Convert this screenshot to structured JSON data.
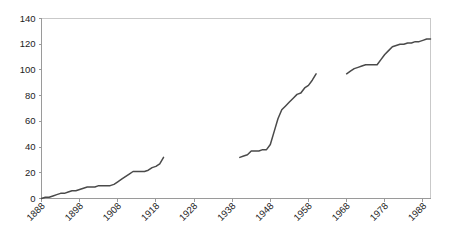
{
  "chart_data": {
    "type": "line",
    "title": "",
    "subtitle": "",
    "xlabel": "",
    "ylabel": "",
    "xlim": [
      1888,
      1990
    ],
    "ylim": [
      0,
      140
    ],
    "grid": false,
    "legend": false,
    "legend_position": "none",
    "line_color": "#4a4a4a",
    "axis_color": "#9a9a9a",
    "border_color": "#c9c9c9",
    "y_ticks": [
      0,
      20,
      40,
      60,
      80,
      100,
      120,
      140
    ],
    "y_tick_labels": [
      "0",
      "20",
      "40",
      "60",
      "80",
      "100",
      "120",
      "140"
    ],
    "x_ticks": [
      1888,
      1898,
      1908,
      1918,
      1928,
      1938,
      1948,
      1958,
      1968,
      1978,
      1988
    ],
    "x_tick_labels": [
      "1888",
      "1898",
      "1908",
      "1918",
      "1928",
      "1938",
      "1948",
      "1958",
      "1968",
      "1978",
      "1988"
    ],
    "x_tick_label_rotation": -45,
    "series": [
      {
        "name": "segment-1",
        "x": [
          1888,
          1889,
          1890,
          1891,
          1892,
          1893,
          1894,
          1895,
          1896,
          1897,
          1898,
          1899,
          1900,
          1901,
          1902,
          1903,
          1904,
          1905,
          1906,
          1907,
          1908,
          1909,
          1910,
          1911,
          1912,
          1913,
          1914,
          1915,
          1916,
          1917,
          1918,
          1919,
          1920
        ],
        "values": [
          0,
          1,
          1,
          2,
          3,
          4,
          4,
          5,
          6,
          6,
          7,
          8,
          9,
          9,
          9,
          10,
          10,
          10,
          10,
          11,
          13,
          15,
          17,
          19,
          21,
          21,
          21,
          21,
          22,
          24,
          25,
          27,
          32
        ]
      },
      {
        "name": "segment-2",
        "x": [
          1940,
          1941,
          1942,
          1943,
          1944,
          1945,
          1946,
          1947,
          1948,
          1949,
          1950,
          1951,
          1952,
          1953,
          1954,
          1955,
          1956,
          1957,
          1958,
          1959,
          1960
        ],
        "values": [
          32,
          33,
          34,
          37,
          37,
          37,
          38,
          38,
          42,
          52,
          62,
          69,
          72,
          75,
          78,
          81,
          82,
          86,
          88,
          92,
          97
        ]
      },
      {
        "name": "segment-3",
        "x": [
          1968,
          1969,
          1970,
          1971,
          1972,
          1973,
          1974,
          1975,
          1976,
          1977,
          1978,
          1979,
          1980,
          1981,
          1982,
          1983,
          1984,
          1985,
          1986,
          1987,
          1988,
          1989,
          1990
        ],
        "values": [
          97,
          99,
          101,
          102,
          103,
          104,
          104,
          104,
          104,
          108,
          112,
          115,
          118,
          119,
          120,
          120,
          121,
          121,
          122,
          122,
          123,
          124,
          124
        ]
      }
    ]
  }
}
